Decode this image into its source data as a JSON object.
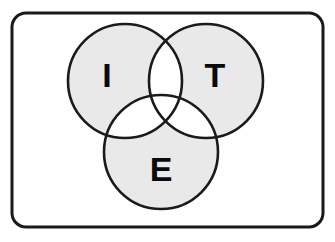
{
  "diagram": {
    "type": "venn",
    "set_count": 3,
    "frame": {
      "shape": "rounded-rectangle",
      "x": 12,
      "y": 13,
      "width": 311,
      "height": 214,
      "corner_radius": 14,
      "stroke_color": "#1a1a1a",
      "stroke_width": 3,
      "fill_color": "#ffffff"
    },
    "style": {
      "circle_fill": "#e9e9e9",
      "overlap_fill": "#ffffff",
      "circle_stroke": "#1a1a1a",
      "circle_stroke_width": 2.6,
      "label_color": "#0a0a0a",
      "background": "#ffffff"
    },
    "circles": [
      {
        "id": "set-i",
        "label": "I",
        "cx": 125,
        "cy": 81,
        "r": 57,
        "label_x": 107,
        "label_y": 78
      },
      {
        "id": "set-t",
        "label": "T",
        "cx": 206,
        "cy": 81,
        "r": 57,
        "label_x": 215,
        "label_y": 78
      },
      {
        "id": "set-e",
        "label": "E",
        "cx": 161,
        "cy": 152,
        "r": 57,
        "label_x": 161,
        "label_y": 172
      }
    ]
  }
}
